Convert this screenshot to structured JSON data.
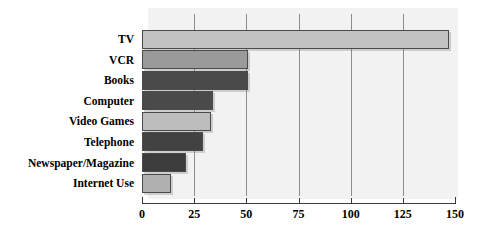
{
  "chart_data": {
    "type": "bar",
    "orientation": "horizontal",
    "title": "",
    "subtitle": "",
    "xlabel": "",
    "ylabel": "",
    "xlim": [
      0,
      150
    ],
    "ylim": null,
    "grid": true,
    "gridlines": [
      25,
      50,
      75,
      100,
      125
    ],
    "legend": null,
    "legend_position": "none",
    "xticks": [
      0,
      25,
      50,
      75,
      100,
      125,
      150
    ],
    "xticklabels": [
      "0",
      "25",
      "50",
      "75",
      "100",
      "125",
      "150"
    ],
    "categories": [
      "TV",
      "VCR",
      "Books",
      "Computer",
      "Video Games",
      "Telephone",
      "Newspaper/Magazine",
      "Internet Use"
    ],
    "values": [
      147,
      51,
      51,
      34,
      33,
      29,
      21,
      14
    ],
    "bar_colors": [
      "#c2c2c2",
      "#9a9a9a",
      "#4a4a4a",
      "#4a4a4a",
      "#bdbdbd",
      "#424242",
      "#3c3c3c",
      "#b0b0b0"
    ],
    "bar_edge_color": "#4a4a4a",
    "plot_background": "#f2f2f2",
    "page_background": "#ffffff",
    "axis_color": "#3a3a3a",
    "gridline_color": "#8d8d8d",
    "text_color": "#000000"
  }
}
